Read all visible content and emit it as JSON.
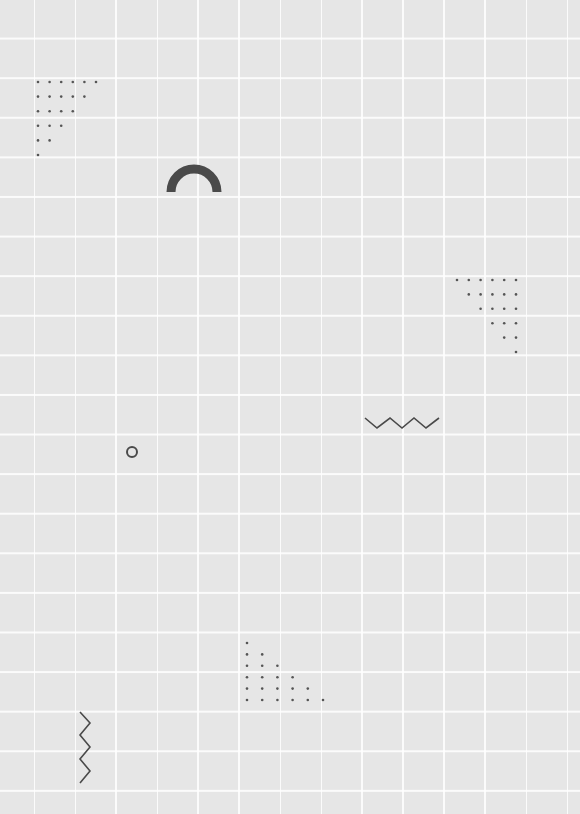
{
  "page": {
    "background_color": "#e6e6e6",
    "grid_line_color": "#ffffff",
    "shape_color": "#4a4a4a",
    "dot_color": "#555555"
  },
  "shapes": [
    {
      "type": "dot-triangle",
      "name": "dots-top-left",
      "corner": "top-left",
      "origin": [
        38,
        82
      ],
      "step_x": 11.6,
      "step_y": 14.6,
      "rows": 6
    },
    {
      "type": "half-ring",
      "name": "arch",
      "center": [
        194,
        192
      ],
      "radius": 23,
      "stroke": 9
    },
    {
      "type": "dot-triangle",
      "name": "dots-right",
      "corner": "top-right",
      "origin": [
        516,
        280
      ],
      "step_x": 11.8,
      "step_y": 14.4,
      "rows": 6
    },
    {
      "type": "zigzag-horizontal",
      "name": "zigzag-horizontal",
      "points": [
        [
          365,
          418
        ],
        [
          377,
          428
        ],
        [
          390,
          418
        ],
        [
          402,
          428
        ],
        [
          414,
          418
        ],
        [
          426,
          428
        ],
        [
          439,
          418
        ]
      ]
    },
    {
      "type": "ring",
      "name": "small-ring",
      "center": [
        132,
        452
      ],
      "radius": 5
    },
    {
      "type": "dot-triangle",
      "name": "dots-bottom",
      "corner": "bottom-left",
      "origin": [
        247,
        700
      ],
      "step_x": 15.2,
      "step_y": 11.4,
      "rows": 6
    },
    {
      "type": "zigzag-vertical",
      "name": "zigzag-vertical",
      "points": [
        [
          80,
          712
        ],
        [
          90,
          723
        ],
        [
          80,
          735
        ],
        [
          90,
          747
        ],
        [
          80,
          759
        ],
        [
          90,
          771
        ],
        [
          80,
          783
        ]
      ]
    }
  ]
}
